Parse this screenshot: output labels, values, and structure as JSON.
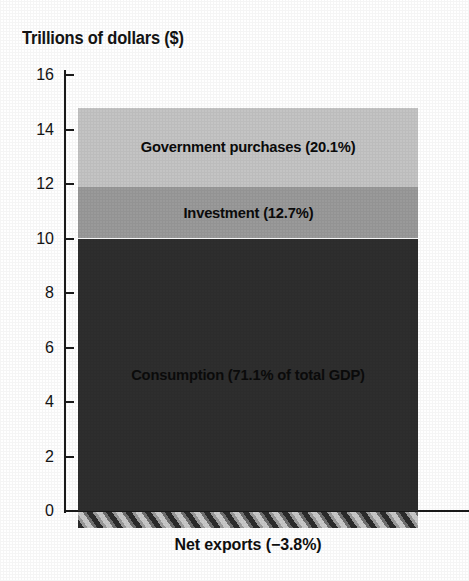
{
  "chart_data": {
    "type": "bar",
    "title": "Trillions of dollars ($)",
    "subtitle": "",
    "xlabel": "",
    "ylabel": "Trillions of dollars ($)",
    "ylim": [
      0,
      16
    ],
    "ytick_labels": [
      "0",
      "2",
      "4",
      "6",
      "8",
      "10",
      "12",
      "14",
      "16"
    ],
    "ytick_values": [
      0,
      2,
      4,
      6,
      8,
      10,
      12,
      14,
      16
    ],
    "grid": false,
    "legend_position": "in-bar-labels",
    "categories": [
      "GDP components"
    ],
    "stacked": true,
    "series": [
      {
        "name": "Consumption",
        "label": "Consumption (71.1% of total GDP)",
        "percent": 71.1,
        "value_start": 0,
        "value_end": 10.0,
        "values": [
          10.0
        ],
        "color": "#2e2e2e"
      },
      {
        "name": "Investment",
        "label": "Investment (12.7%)",
        "percent": 12.7,
        "value_start": 10.0,
        "value_end": 11.9,
        "values": [
          1.9
        ],
        "color": "#9a9a9a"
      },
      {
        "name": "Government purchases",
        "label": "Government purchases (20.1%)",
        "percent": 20.1,
        "value_start": 11.9,
        "value_end": 14.8,
        "values": [
          2.9
        ],
        "color": "#c4c4c4"
      },
      {
        "name": "Net exports",
        "label": "Net exports (−3.8%)",
        "percent": -3.8,
        "value_start": 0,
        "value_end": -0.55,
        "values": [
          -0.55
        ],
        "color": "hatched-gray"
      }
    ],
    "annotations": [
      "Government purchases (20.1%)",
      "Investment (12.7%)",
      "Consumption (71.1% of total GDP)",
      "Net exports (−3.8%)"
    ]
  },
  "axis": {
    "title": "Trillions of dollars ($)",
    "ticks": [
      {
        "label": "16",
        "value": 16
      },
      {
        "label": "14",
        "value": 14
      },
      {
        "label": "12",
        "value": 12
      },
      {
        "label": "10",
        "value": 10
      },
      {
        "label": "8",
        "value": 8
      },
      {
        "label": "6",
        "value": 6
      },
      {
        "label": "4",
        "value": 4
      },
      {
        "label": "2",
        "value": 2
      },
      {
        "label": "0",
        "value": 0
      }
    ]
  },
  "bar_segments": [
    {
      "key": "government",
      "label": "Government purchases (20.1%)"
    },
    {
      "key": "investment",
      "label": "Investment (12.7%)"
    },
    {
      "key": "consumption",
      "label": "Consumption (71.1% of total GDP)"
    }
  ],
  "net_exports": {
    "label": "Net exports (−3.8%)"
  },
  "colors": {
    "government": "#c4c4c4",
    "investment": "#9a9a9a",
    "consumption": "#2e2e2e",
    "net_exports_base": "#8e8e8e",
    "axis": "#1a1a1a",
    "text": "#111111",
    "background": "#ffffff"
  }
}
